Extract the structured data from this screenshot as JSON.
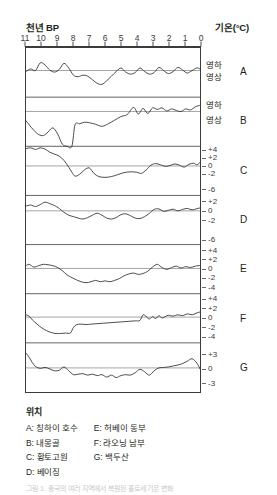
{
  "header": {
    "left_label": "천년 BP",
    "right_label": "기온(°C)"
  },
  "legend": {
    "title": "위치",
    "column_left": [
      "A: 칭하이 호수",
      "B: 내몽골",
      "C: 황토고원",
      "D: 베이징"
    ],
    "column_right": [
      "E: 허베이 동부",
      "F: 랴오닝 남부",
      "G: 백두산"
    ]
  },
  "caption": "그림 1. 중국의 여러 지역에서 복원된 홀로세 기온 변화",
  "chart_data": {
    "type": "line",
    "xlabel": "천년 BP",
    "ylabel": "기온(°C)",
    "xlim": [
      11,
      0
    ],
    "x_ticks": [
      11,
      10,
      9,
      8,
      7,
      6,
      5,
      4,
      3,
      2,
      1,
      0
    ],
    "x_tick_labels": [
      "11",
      "10",
      "9",
      "8",
      "7",
      "6",
      "5",
      "4",
      "3",
      "2",
      "1",
      "0"
    ],
    "grid": false,
    "legend_position": "below-plot",
    "panels": [
      {
        "id": "A",
        "name": "칭하이 호수",
        "y_tick_values": [
          0.6,
          -0.6
        ],
        "y_tick_labels": [
          "영하",
          "영상"
        ],
        "zero_line": 0,
        "ylim": [
          -2.6,
          2.2
        ],
        "x": [
          11.0,
          10.7,
          10.4,
          10.1,
          9.8,
          9.5,
          9.2,
          8.9,
          8.6,
          8.3,
          8.0,
          7.7,
          7.4,
          7.1,
          6.8,
          6.5,
          6.2,
          5.9,
          5.6,
          5.3,
          5.0,
          4.7,
          4.4,
          4.1,
          3.8,
          3.5,
          3.2,
          2.9,
          2.6,
          2.3,
          2.0,
          1.7,
          1.4,
          1.1,
          0.8,
          0.5,
          0.2,
          0.0
        ],
        "y": [
          -0.1,
          0.15,
          0.0,
          0.75,
          0.55,
          0.05,
          -0.15,
          0.1,
          0.7,
          0.25,
          -0.45,
          -0.6,
          -0.45,
          -0.55,
          -0.9,
          -1.25,
          -1.35,
          -1.0,
          -0.55,
          -0.1,
          0.25,
          -0.15,
          -0.35,
          -0.2,
          0.25,
          -0.1,
          -0.35,
          -0.2,
          0.3,
          0.0,
          -0.3,
          -0.1,
          0.3,
          0.05,
          -0.25,
          0.0,
          0.25,
          0.15
        ]
      },
      {
        "id": "B",
        "name": "내몽골",
        "y_tick_values": [
          0.7,
          -0.7
        ],
        "y_tick_labels": [
          "영하",
          "영상"
        ],
        "zero_line": 0,
        "ylim": [
          -3.4,
          1.4
        ],
        "x": [
          11.0,
          10.8,
          10.5,
          10.2,
          9.9,
          9.6,
          9.3,
          9.0,
          8.7,
          8.4,
          8.1,
          7.9,
          7.6,
          7.3,
          7.0,
          6.6,
          6.2,
          5.8,
          5.4,
          5.0,
          4.6,
          4.2,
          3.9,
          3.6,
          3.3,
          3.0,
          2.7,
          2.4,
          2.1,
          1.8,
          1.5,
          1.2,
          0.9,
          0.6,
          0.3,
          0.0
        ],
        "y": [
          -0.9,
          -1.3,
          -1.85,
          -2.25,
          -2.35,
          -2.0,
          -1.6,
          -2.2,
          -3.2,
          -3.4,
          -3.4,
          -1.3,
          -1.2,
          -1.05,
          -1.1,
          -1.25,
          -1.45,
          -1.2,
          -0.85,
          -0.5,
          -0.3,
          0.4,
          -0.25,
          0.3,
          -0.2,
          0.35,
          0.2,
          0.35,
          0.05,
          0.25,
          0.1,
          0.0,
          0.25,
          0.15,
          0.45,
          0.6
        ]
      },
      {
        "id": "C",
        "name": "황토고원",
        "y_tick_values": [
          -6,
          -2,
          0,
          2,
          4
        ],
        "y_tick_labels": [
          "-6",
          "-2",
          "0",
          "+2",
          "+4"
        ],
        "zero_line": 0,
        "ylim": [
          -7.5,
          5.0
        ],
        "x": [
          11.0,
          10.7,
          10.4,
          10.1,
          9.8,
          9.5,
          9.2,
          8.9,
          8.6,
          8.3,
          8.1,
          7.9,
          7.6,
          7.3,
          7.0,
          6.7,
          6.4,
          6.0,
          5.6,
          5.2,
          4.8,
          4.4,
          4.0,
          3.7,
          3.4,
          3.1,
          2.8,
          2.5,
          2.2,
          1.9,
          1.6,
          1.3,
          1.0,
          0.7,
          0.4,
          0.2,
          0.0
        ],
        "y": [
          4.4,
          4.6,
          4.2,
          4.6,
          4.3,
          3.5,
          3.0,
          2.5,
          1.4,
          -0.3,
          -1.6,
          -2.6,
          -2.1,
          -1.0,
          -0.5,
          -1.9,
          -2.7,
          -2.9,
          -2.7,
          -2.2,
          -1.7,
          -1.5,
          -1.6,
          -1.9,
          -1.0,
          0.2,
          0.6,
          0.3,
          -0.1,
          0.1,
          0.5,
          0.2,
          -0.3,
          0.4,
          0.7,
          0.3,
          0.9
        ]
      },
      {
        "id": "D",
        "name": "베이징",
        "y_tick_values": [
          -6,
          -2,
          0,
          2
        ],
        "y_tick_labels": [
          "-6",
          "-2",
          "0",
          "+2"
        ],
        "zero_line": 0,
        "ylim": [
          -7.0,
          3.2
        ],
        "x": [
          11.0,
          10.7,
          10.4,
          10.1,
          9.8,
          9.5,
          9.2,
          8.9,
          8.6,
          8.3,
          8.0,
          7.7,
          7.4,
          7.1,
          6.8,
          6.5,
          6.2,
          5.9,
          5.6,
          5.3,
          5.0,
          4.7,
          4.4,
          4.1,
          3.8,
          3.5,
          3.2,
          2.9,
          2.6,
          2.3,
          2.0,
          1.7,
          1.4,
          1.1,
          0.8,
          0.5,
          0.2,
          0.0
        ],
        "y": [
          1.0,
          1.2,
          0.9,
          1.3,
          1.8,
          1.5,
          1.1,
          0.5,
          -0.3,
          -0.9,
          -1.2,
          -1.5,
          -1.7,
          -1.4,
          -0.9,
          -0.5,
          -0.9,
          -1.5,
          -1.7,
          -1.4,
          -0.8,
          -0.6,
          -1.0,
          -1.5,
          -1.6,
          -1.2,
          -0.5,
          0.3,
          0.4,
          -0.1,
          0.1,
          0.35,
          0.0,
          0.3,
          0.5,
          0.2,
          0.45,
          0.6
        ]
      },
      {
        "id": "E",
        "name": "허베이 동부",
        "y_tick_values": [
          -4,
          -2,
          0,
          2,
          4
        ],
        "y_tick_labels": [
          "-4",
          "-2",
          "0",
          "+2",
          "+4"
        ],
        "zero_line": 0,
        "ylim": [
          -5.5,
          5.2
        ],
        "x": [
          11.0,
          10.8,
          10.5,
          10.2,
          9.9,
          9.6,
          9.3,
          9.0,
          8.7,
          8.4,
          8.1,
          7.8,
          7.5,
          7.2,
          6.9,
          6.6,
          6.3,
          6.0,
          5.7,
          5.4,
          5.1,
          4.8,
          4.5,
          4.2,
          3.9,
          3.6,
          3.3,
          3.0,
          2.7,
          2.4,
          2.1,
          1.8,
          1.5,
          1.2,
          0.9,
          0.6,
          0.3,
          0.0
        ],
        "y": [
          0.6,
          0.9,
          0.3,
          0.6,
          0.9,
          0.8,
          0.6,
          0.2,
          -0.5,
          -1.4,
          -2.0,
          -2.5,
          -2.9,
          -3.1,
          -2.9,
          -2.6,
          -2.9,
          -2.7,
          -2.9,
          -2.6,
          -2.2,
          -1.6,
          -1.2,
          -1.0,
          -1.3,
          -1.1,
          -0.6,
          0.3,
          0.9,
          0.2,
          -0.2,
          0.2,
          0.5,
          0.1,
          0.4,
          0.2,
          0.5,
          0.65
        ]
      },
      {
        "id": "F",
        "name": "랴오닝 남부",
        "y_tick_values": [
          -4,
          -2,
          0,
          2,
          4
        ],
        "y_tick_labels": [
          "-4",
          "-2",
          "0",
          "+2",
          "+4"
        ],
        "zero_line": 0,
        "ylim": [
          -5.5,
          5.0
        ],
        "x": [
          11.0,
          10.8,
          10.6,
          10.3,
          10.0,
          9.7,
          9.4,
          9.1,
          8.8,
          8.5,
          8.2,
          8.0,
          7.8,
          7.5,
          7.2,
          6.9,
          6.5,
          6.1,
          5.7,
          5.3,
          4.9,
          4.5,
          4.1,
          3.8,
          3.6,
          3.4,
          3.2,
          3.0,
          2.8,
          2.6,
          2.4,
          2.2,
          2.0,
          1.7,
          1.4,
          1.1,
          0.8,
          0.5,
          0.2,
          0.0
        ],
        "y": [
          0.5,
          0.2,
          -0.6,
          -1.5,
          -2.3,
          -2.9,
          -3.3,
          -3.5,
          -3.5,
          -3.4,
          -3.4,
          -2.2,
          -1.6,
          -1.5,
          -1.6,
          -1.5,
          -1.4,
          -1.3,
          -1.2,
          -1.1,
          -1.0,
          -0.9,
          -0.8,
          -0.7,
          0.5,
          0.1,
          -0.4,
          0.1,
          -0.3,
          0.3,
          -0.2,
          0.1,
          0.4,
          0.2,
          0.5,
          0.3,
          0.7,
          0.5,
          0.9,
          1.1
        ]
      },
      {
        "id": "G",
        "name": "백두산",
        "y_tick_values": [
          -3,
          0,
          3
        ],
        "y_tick_labels": [
          "-3",
          "0",
          "+3"
        ],
        "zero_line": 0,
        "ylim": [
          -5.0,
          5.2
        ],
        "x": [
          11.0,
          10.8,
          10.6,
          10.4,
          10.1,
          9.8,
          9.5,
          9.2,
          8.9,
          8.6,
          8.3,
          8.0,
          7.7,
          7.4,
          7.1,
          6.8,
          6.5,
          6.2,
          5.9,
          5.6,
          5.3,
          5.0,
          4.7,
          4.4,
          4.1,
          3.8,
          3.5,
          3.2,
          2.9,
          2.6,
          2.3,
          2.0,
          1.7,
          1.4,
          1.1,
          0.8,
          0.5,
          0.2,
          0.0
        ],
        "y": [
          3.1,
          2.2,
          1.1,
          0.3,
          -0.1,
          0.1,
          -0.2,
          -0.6,
          -0.5,
          0.2,
          -0.6,
          -1.4,
          -1.3,
          -1.2,
          -1.5,
          -1.3,
          -1.6,
          -1.4,
          -1.9,
          -1.5,
          -2.0,
          -1.6,
          -1.4,
          -1.5,
          -1.0,
          -0.3,
          -0.8,
          -1.5,
          -0.6,
          0.0,
          0.1,
          0.2,
          0.4,
          0.6,
          0.9,
          1.4,
          1.9,
          1.0,
          -0.2
        ]
      }
    ]
  }
}
